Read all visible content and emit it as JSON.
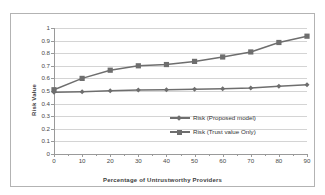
{
  "chart_data": {
    "type": "line",
    "title": "",
    "xlabel": "Percentage of Untrustworthy Providers",
    "ylabel": "Risk Value",
    "x": [
      0,
      10,
      20,
      30,
      40,
      50,
      60,
      70,
      80,
      90
    ],
    "xlim": [
      0,
      90
    ],
    "ylim": [
      0,
      1
    ],
    "xticks": [
      "0",
      "10",
      "20",
      "30",
      "40",
      "50",
      "60",
      "70",
      "80",
      "90"
    ],
    "yticks": [
      "0",
      "0.1",
      "0.2",
      "0.3",
      "0.4",
      "0.5",
      "0.6",
      "0.7",
      "0.8",
      "0.9",
      "1"
    ],
    "grid": "horizontal",
    "legend_position": "inside-lower-right",
    "series": [
      {
        "name": "Risk (Proposed model)",
        "marker": "diamond",
        "color": "#6e6e6e",
        "values": [
          0.49,
          0.495,
          0.502,
          0.507,
          0.51,
          0.513,
          0.517,
          0.524,
          0.538,
          0.55
        ]
      },
      {
        "name": "Risk (Trust value Only)",
        "marker": "square",
        "color": "#6e6e6e",
        "values": [
          0.51,
          0.6,
          0.665,
          0.7,
          0.71,
          0.735,
          0.77,
          0.81,
          0.885,
          0.935
        ]
      }
    ]
  },
  "figure": {
    "border_color": "#b3b3b3",
    "background": "#ffffff",
    "gridline_color": "#d4d4d4",
    "axis_color": "#9a9a9a"
  },
  "legend": {
    "entries": [
      {
        "label": "Risk (Proposed model)"
      },
      {
        "label": "Risk (Trust value Only)"
      }
    ]
  }
}
